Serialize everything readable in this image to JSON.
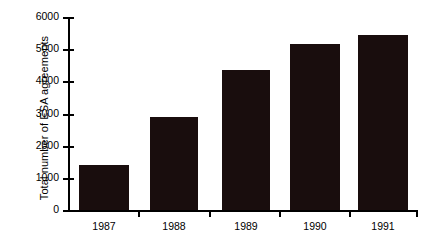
{
  "chart_data": {
    "type": "bar",
    "title": "",
    "subtitle": "",
    "xlabel": "",
    "ylabel": "Total number of ESA agreements",
    "categories": [
      "1987",
      "1988",
      "1989",
      "1990",
      "1991"
    ],
    "values": [
      1400,
      2900,
      4350,
      5150,
      5450
    ],
    "series": [
      {
        "name": "Total number of ESA agreements",
        "values": [
          1400,
          2900,
          4350,
          5150,
          5450
        ]
      }
    ],
    "ylim": [
      0,
      6000
    ],
    "ytick_values": [
      0,
      1000,
      2000,
      3000,
      4000,
      5000,
      6000
    ],
    "ytick_labels": [
      "0",
      "1000",
      "2000",
      "3000",
      "4000",
      "5000",
      "6000"
    ],
    "xtick_labels": [
      "1987",
      "1988",
      "1989",
      "1990",
      "1991"
    ],
    "grid": false,
    "legend": false,
    "legend_position": "none",
    "bar_color": "#190d0d",
    "axis_color": "#000000",
    "background_color": "#ffffff",
    "annotations": []
  }
}
